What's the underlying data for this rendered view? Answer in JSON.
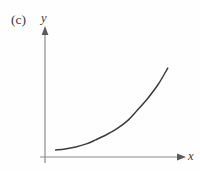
{
  "figure": {
    "panel_label": "(c)",
    "background_color": "#fefefe",
    "axis_color": "#8a8a8a",
    "curve_color": "#3c3c3c",
    "text_color": "#3a3a3a"
  },
  "axes": {
    "y_label": "y",
    "x_label": "x",
    "y_arrow_icon": "arrow-up-icon",
    "x_arrow_icon": "arrow-right-icon",
    "origin": {
      "x": 45,
      "y": 157
    },
    "y_axis_top": 28,
    "x_axis_right": 185
  },
  "chart_data": {
    "type": "line",
    "title": "(c)",
    "xlabel": "x",
    "ylabel": "y",
    "grid": false,
    "legend": false,
    "axis_ticks": false,
    "xlim": [
      0,
      1
    ],
    "ylim": [
      0,
      1
    ],
    "series": [
      {
        "name": "exponential curve",
        "x": [
          0.09,
          0.17,
          0.26,
          0.35,
          0.43,
          0.52,
          0.61,
          0.7,
          0.78,
          0.87,
          0.96,
          1.04
        ],
        "y": [
          0.07,
          0.08,
          0.1,
          0.13,
          0.17,
          0.22,
          0.28,
          0.36,
          0.46,
          0.58,
          0.72,
          0.88
        ]
      }
    ]
  }
}
